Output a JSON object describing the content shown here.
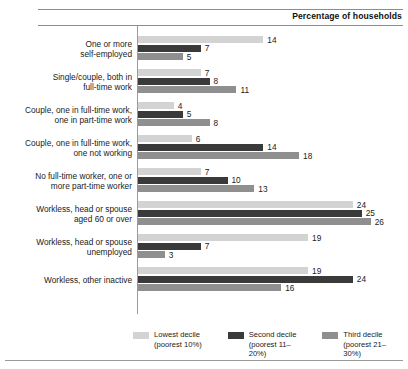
{
  "header": {
    "axis_caption": "Percentage of households"
  },
  "chart_data": {
    "type": "bar",
    "orientation": "horizontal",
    "title": "",
    "xlabel": "Percentage of households",
    "ylabel": "",
    "xlim": [
      0,
      26
    ],
    "grid": false,
    "legend_position": "bottom",
    "categories": [
      "One or more\nself-employed",
      "Single/couple, both in\nfull-time work",
      "Couple, one in full-time work,\none in part-time work",
      "Couple, one in full-time work,\none not working",
      "No full-time worker, one or\nmore part-time worker",
      "Workless, head or spouse\naged 60 or over",
      "Workless, head or spouse\nunemployed",
      "Workless, other inactive"
    ],
    "series": [
      {
        "name": "Lowest decile",
        "sub": "(poorest 10%)",
        "color": "#d3d3d3",
        "values": [
          14,
          7,
          4,
          6,
          7,
          24,
          19,
          19
        ]
      },
      {
        "name": "Second decile",
        "sub": "(poorest 11–20%)",
        "color": "#3a3a3a",
        "values": [
          7,
          8,
          5,
          14,
          10,
          25,
          7,
          24
        ]
      },
      {
        "name": "Third decile",
        "sub": "(poorest 21–30%)",
        "color": "#8f8f8f",
        "values": [
          5,
          11,
          8,
          18,
          13,
          26,
          3,
          16
        ]
      }
    ]
  }
}
